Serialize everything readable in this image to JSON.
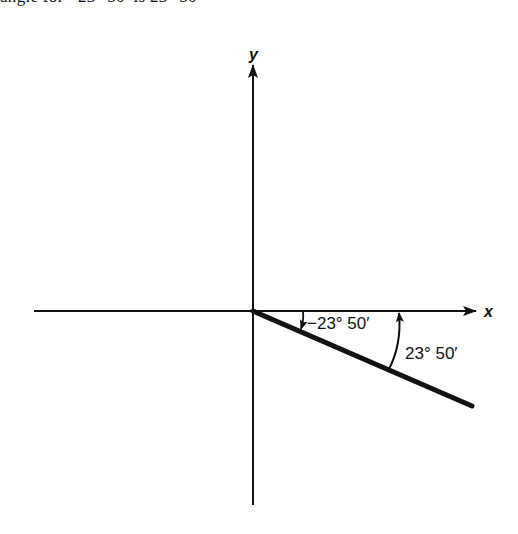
{
  "caption": {
    "text": "angle for −23° 50′ is 23° 50′"
  },
  "diagram": {
    "axes": {
      "x_label": "x",
      "y_label": "y"
    },
    "angles": [
      {
        "label": "−23° 50′",
        "direction": "clockwise",
        "meaning": "negative angle measured from positive x-axis"
      },
      {
        "label": "23° 50′",
        "direction": "counterclockwise",
        "meaning": "reference angle"
      }
    ],
    "terminal_side": {
      "angle_degrees": -23.83
    },
    "colors": {
      "ink": "#111111",
      "background": "#ffffff"
    }
  }
}
